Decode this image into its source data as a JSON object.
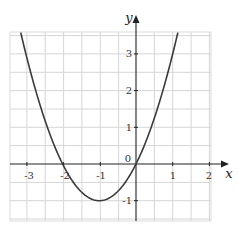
{
  "chart_data": {
    "type": "line",
    "title": "",
    "xlabel": "x",
    "ylabel": "y",
    "xlim": [
      -3.43,
      2.04
    ],
    "ylim": [
      -1.55,
      3.6
    ],
    "grid": true,
    "grid_step": 0.5,
    "x_ticks": [
      "-3",
      "-2",
      "-1",
      "0",
      "1",
      "2"
    ],
    "y_ticks": [
      "-1",
      "1",
      "2",
      "3"
    ],
    "origin_label": "0",
    "series": [
      {
        "name": "y = x² + 2x",
        "equation": "y = x^2 + 2x",
        "roots": [
          -2,
          0
        ],
        "vertex": [
          -1,
          -1
        ],
        "x": [
          -3.3,
          -3,
          -2.5,
          -2,
          -1.5,
          -1,
          -0.5,
          0,
          0.5,
          1,
          1.15
        ],
        "values": [
          4.29,
          3,
          1.25,
          0,
          -0.75,
          -1,
          -0.75,
          0,
          1.25,
          3,
          3.62
        ]
      }
    ],
    "colors": {
      "curve": "#3a3a3a",
      "grid": "#d4d4d4",
      "axis": "#222222"
    }
  },
  "labels": {
    "x_axis": "x",
    "y_axis": "y",
    "origin": "0",
    "x_ticks": {
      "m3": "-3",
      "m2": "-2",
      "m1": "-1",
      "p1": "1",
      "p2": "2"
    },
    "y_ticks": {
      "m1": "-1",
      "p1": "1",
      "p2": "2",
      "p3": "3"
    }
  }
}
